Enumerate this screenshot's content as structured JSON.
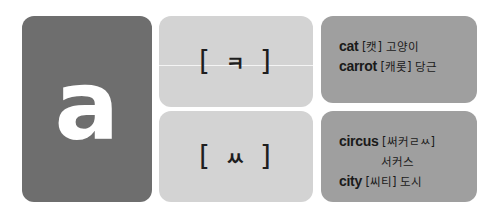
{
  "letter_card": {
    "letter": "a",
    "bg_color": "#6e6e6e"
  },
  "sounds": [
    {
      "open": "[",
      "jamo": "ㅋ",
      "close": "]"
    },
    {
      "open": "[",
      "jamo": "ㅆ",
      "close": "]"
    }
  ],
  "examples": [
    {
      "lines": [
        {
          "word": "cat",
          "pron": "[캣]",
          "meaning": "고양이"
        },
        {
          "word": "carrot",
          "pron": "[캐롯]",
          "meaning": "당근"
        }
      ]
    },
    {
      "lines": [
        {
          "word": "circus",
          "pron": "[써커ㄹㅆ]",
          "meaning": "서커스"
        },
        {
          "word": "city",
          "pron": "[씨티]",
          "meaning": "도시"
        }
      ]
    }
  ],
  "colors": {
    "letter_card": "#6e6e6e",
    "sound_card": "#d3d3d3",
    "example_card": "#9f9f9f"
  }
}
